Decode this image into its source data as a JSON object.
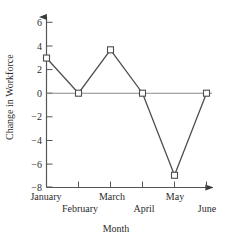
{
  "chart_data": {
    "type": "line",
    "title": "",
    "xlabel": "Month",
    "ylabel": "Change in Workforce",
    "categories": [
      "January",
      "February",
      "March",
      "April",
      "May",
      "June"
    ],
    "values": [
      3,
      0,
      3.7,
      0,
      -7,
      0
    ],
    "series": [
      {
        "name": "Change in Workforce",
        "values": [
          3,
          0,
          3.7,
          0,
          -7,
          0
        ]
      }
    ],
    "ylim": [
      -8,
      7
    ],
    "yticks": [
      6,
      4,
      2,
      0,
      -2,
      -4,
      -6,
      -8
    ],
    "ytick_labels": [
      "6",
      "4",
      "2",
      "0",
      "−2",
      "−4",
      "−6",
      "−8"
    ],
    "grid": false,
    "legend": "none",
    "marker": "open-square",
    "line_color": "#4d4d4d",
    "marker_color": "#4d4d4d",
    "axis_color": "#555555",
    "zero_line": true
  },
  "axes": {
    "y_title": "Change in Workforce",
    "x_title": "Month"
  },
  "yticks": [
    {
      "label": "6",
      "value": 6
    },
    {
      "label": "4",
      "value": 4
    },
    {
      "label": "2",
      "value": 2
    },
    {
      "label": "0",
      "value": 0
    },
    {
      "label": "−2",
      "value": -2
    },
    {
      "label": "−4",
      "value": -4
    },
    {
      "label": "−6",
      "value": -6
    },
    {
      "label": "−8",
      "value": -8
    }
  ],
  "xticks": [
    {
      "label": "January",
      "row": "top"
    },
    {
      "label": "February",
      "row": "bottom"
    },
    {
      "label": "March",
      "row": "top"
    },
    {
      "label": "April",
      "row": "bottom"
    },
    {
      "label": "May",
      "row": "top"
    },
    {
      "label": "June",
      "row": "bottom"
    }
  ]
}
